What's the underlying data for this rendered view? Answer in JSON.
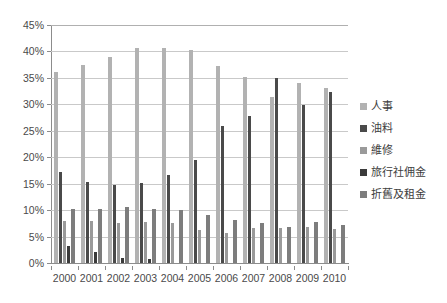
{
  "chart_data": {
    "type": "bar",
    "title": "",
    "subtitle": "",
    "xlabel": "",
    "ylabel": "",
    "ylim": [
      0,
      45
    ],
    "ytick_values": [
      0,
      5,
      10,
      15,
      20,
      25,
      30,
      35,
      40,
      45
    ],
    "ytick_labels": [
      "0%",
      "5%",
      "10%",
      "15%",
      "20%",
      "25%",
      "30%",
      "35%",
      "40%",
      "45%"
    ],
    "grid": true,
    "legend_position": "right",
    "categories": [
      "2000",
      "2001",
      "2002",
      "2003",
      "2004",
      "2005",
      "2006",
      "2007",
      "2008",
      "2009",
      "2010"
    ],
    "series": [
      {
        "name": "人事",
        "color": "#b2b2b2",
        "values": [
          36.2,
          37.5,
          38.9,
          40.6,
          40.7,
          40.3,
          37.2,
          35.2,
          31.4,
          34.0,
          33.1
        ]
      },
      {
        "name": "油料",
        "color": "#4a4a4a",
        "values": [
          17.3,
          15.4,
          14.8,
          15.1,
          16.6,
          19.5,
          26.0,
          27.8,
          34.9,
          29.9,
          32.3
        ]
      },
      {
        "name": "維修",
        "color": "#9a9a9a",
        "values": [
          8.0,
          7.9,
          7.5,
          7.8,
          7.5,
          6.2,
          5.6,
          6.6,
          6.6,
          6.9,
          6.4
        ]
      },
      {
        "name": "旅行社佣金",
        "color": "#3b3b3b",
        "values": [
          3.3,
          2.0,
          0.9,
          0.7,
          0.0,
          0.0,
          0.0,
          0.0,
          0.0,
          0.0,
          0.0
        ]
      },
      {
        "name": "折舊及租金",
        "color": "#7d7d7d",
        "values": [
          10.2,
          10.2,
          10.5,
          10.2,
          10.0,
          9.1,
          8.1,
          7.6,
          6.9,
          7.7,
          7.1
        ]
      }
    ]
  }
}
